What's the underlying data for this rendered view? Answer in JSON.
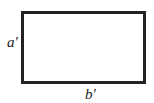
{
  "diagram": {
    "shape": "rectangle",
    "stroke_color": "#222222",
    "fill_color": "#ffffff",
    "labels": {
      "left_side": "a′",
      "bottom_side": "b′"
    }
  }
}
